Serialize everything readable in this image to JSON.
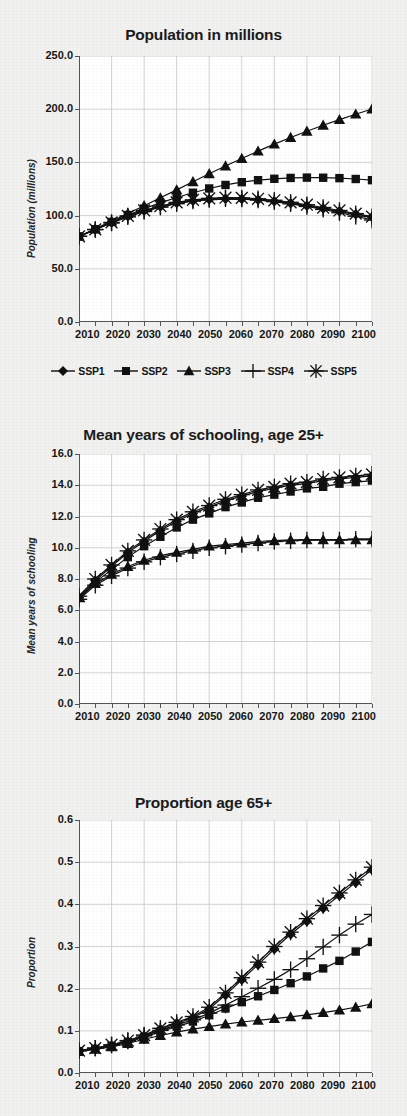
{
  "figure": {
    "background_color": "#f1f1ef",
    "plot_background_color": "#ffffff",
    "line_color": "#111111",
    "grid_color": "#c9c9c9"
  },
  "legend": {
    "position": "below-first-panel",
    "items": [
      {
        "label": "SSP1",
        "marker": "diamond-marker-icon"
      },
      {
        "label": "SSP2",
        "marker": "square-marker-icon"
      },
      {
        "label": "SSP3",
        "marker": "triangle-marker-icon"
      },
      {
        "label": "SSP4",
        "marker": "plus-marker-icon"
      },
      {
        "label": "SSP5",
        "marker": "asterisk-marker-icon"
      }
    ]
  },
  "chart_data": [
    {
      "id": "population",
      "type": "line",
      "title": "Population in millions",
      "xlabel": "",
      "ylabel": "Population (millions)",
      "xlim": [
        2010,
        2100
      ],
      "ylim": [
        0.0,
        250.0
      ],
      "yticks": [
        "0.0",
        "50.0",
        "100.0",
        "150.0",
        "200.0",
        "250.0"
      ],
      "ytick_values": [
        0,
        50,
        100,
        150,
        200,
        250
      ],
      "xticks": [
        "2010",
        "2020",
        "2030",
        "2040",
        "2050",
        "2060",
        "2070",
        "2080",
        "2090",
        "2100"
      ],
      "grid": true,
      "legend": "below",
      "x": [
        2010,
        2015,
        2020,
        2025,
        2030,
        2035,
        2040,
        2045,
        2050,
        2055,
        2060,
        2065,
        2070,
        2075,
        2080,
        2085,
        2090,
        2095,
        2100
      ],
      "series": [
        {
          "name": "SSP1",
          "marker": "diamond",
          "values": [
            80.5,
            87.0,
            93.5,
            99.5,
            104.5,
            108.5,
            111.8,
            114.0,
            115.3,
            115.8,
            115.6,
            114.8,
            113.4,
            111.5,
            109.2,
            106.7,
            104.0,
            101.3,
            98.7
          ]
        },
        {
          "name": "SSP2",
          "marker": "square",
          "values": [
            80.5,
            87.2,
            94.0,
            100.5,
            106.5,
            112.0,
            117.0,
            121.5,
            125.5,
            128.8,
            131.4,
            133.3,
            134.6,
            135.4,
            135.7,
            135.6,
            135.2,
            134.4,
            133.3
          ]
        },
        {
          "name": "SSP3",
          "marker": "triangle",
          "values": [
            80.5,
            87.5,
            94.8,
            102.0,
            109.3,
            116.7,
            124.2,
            131.8,
            139.3,
            146.6,
            153.7,
            160.6,
            167.2,
            173.4,
            179.3,
            184.9,
            190.2,
            195.3,
            200.2
          ]
        },
        {
          "name": "SSP4",
          "marker": "plus",
          "values": [
            80.5,
            86.8,
            93.0,
            98.8,
            103.8,
            107.9,
            111.2,
            113.6,
            115.1,
            115.7,
            115.5,
            114.6,
            113.1,
            111.1,
            108.6,
            105.8,
            102.7,
            99.4,
            95.9
          ]
        },
        {
          "name": "SSP5",
          "marker": "asterisk",
          "values": [
            80.5,
            87.0,
            93.6,
            99.7,
            104.9,
            109.0,
            112.4,
            114.8,
            116.2,
            116.8,
            116.6,
            115.8,
            114.4,
            112.5,
            110.2,
            107.6,
            104.8,
            101.9,
            99.0
          ]
        }
      ]
    },
    {
      "id": "schooling",
      "type": "line",
      "title": "Mean years of schooling, age 25+",
      "xlabel": "",
      "ylabel": "Mean years of schooling",
      "xlim": [
        2010,
        2100
      ],
      "ylim": [
        0.0,
        16.0
      ],
      "yticks": [
        "0.0",
        "2.0",
        "4.0",
        "6.0",
        "8.0",
        "10.0",
        "12.0",
        "14.0",
        "16.0"
      ],
      "ytick_values": [
        0,
        2,
        4,
        6,
        8,
        10,
        12,
        14,
        16
      ],
      "xticks": [
        "2010",
        "2020",
        "2030",
        "2040",
        "2050",
        "2060",
        "2070",
        "2080",
        "2090",
        "2100"
      ],
      "grid": true,
      "legend": "none",
      "x": [
        2010,
        2015,
        2020,
        2025,
        2030,
        2035,
        2040,
        2045,
        2050,
        2055,
        2060,
        2065,
        2070,
        2075,
        2080,
        2085,
        2090,
        2095,
        2100
      ],
      "series": [
        {
          "name": "SSP1",
          "marker": "diamond",
          "values": [
            6.8,
            7.9,
            8.8,
            9.7,
            10.4,
            11.1,
            11.7,
            12.2,
            12.6,
            13.0,
            13.3,
            13.6,
            13.8,
            14.0,
            14.1,
            14.3,
            14.4,
            14.5,
            14.6
          ]
        },
        {
          "name": "SSP2",
          "marker": "square",
          "values": [
            6.8,
            7.8,
            8.6,
            9.4,
            10.1,
            10.7,
            11.3,
            11.8,
            12.2,
            12.6,
            12.9,
            13.2,
            13.4,
            13.6,
            13.8,
            13.9,
            14.1,
            14.2,
            14.3
          ]
        },
        {
          "name": "SSP3",
          "marker": "triangle",
          "values": [
            6.8,
            7.7,
            8.3,
            8.8,
            9.2,
            9.5,
            9.7,
            9.9,
            10.1,
            10.2,
            10.3,
            10.4,
            10.45,
            10.5,
            10.5,
            10.5,
            10.5,
            10.5,
            10.5
          ]
        },
        {
          "name": "SSP4",
          "marker": "plus",
          "values": [
            6.7,
            7.6,
            8.2,
            8.7,
            9.1,
            9.4,
            9.6,
            9.8,
            10.0,
            10.1,
            10.2,
            10.3,
            10.4,
            10.45,
            10.5,
            10.5,
            10.5,
            10.55,
            10.55
          ]
        },
        {
          "name": "SSP5",
          "marker": "asterisk",
          "values": [
            6.9,
            8.0,
            8.9,
            9.8,
            10.5,
            11.2,
            11.8,
            12.3,
            12.7,
            13.1,
            13.4,
            13.7,
            13.9,
            14.1,
            14.2,
            14.4,
            14.5,
            14.6,
            14.7
          ]
        }
      ]
    },
    {
      "id": "proportion",
      "type": "line",
      "title": "Proportion age 65+",
      "xlabel": "",
      "ylabel": "Proportion",
      "xlim": [
        2010,
        2100
      ],
      "ylim": [
        0.0,
        0.6
      ],
      "yticks": [
        "0.0",
        "0.1",
        "0.2",
        "0.3",
        "0.4",
        "0.5",
        "0.6"
      ],
      "ytick_values": [
        0.0,
        0.1,
        0.2,
        0.3,
        0.4,
        0.5,
        0.6
      ],
      "xticks": [
        "2010",
        "2020",
        "2030",
        "2040",
        "2050",
        "2060",
        "2070",
        "2080",
        "2090",
        "2100"
      ],
      "grid": true,
      "legend": "none",
      "x": [
        2010,
        2015,
        2020,
        2025,
        2030,
        2035,
        2040,
        2045,
        2050,
        2055,
        2060,
        2065,
        2070,
        2075,
        2080,
        2085,
        2090,
        2095,
        2100
      ],
      "series": [
        {
          "name": "SSP1",
          "marker": "diamond",
          "values": [
            0.052,
            0.058,
            0.065,
            0.075,
            0.088,
            0.104,
            0.118,
            0.131,
            0.152,
            0.185,
            0.221,
            0.257,
            0.294,
            0.329,
            0.36,
            0.391,
            0.421,
            0.452,
            0.482
          ]
        },
        {
          "name": "SSP2",
          "marker": "square",
          "values": [
            0.052,
            0.057,
            0.064,
            0.073,
            0.085,
            0.098,
            0.11,
            0.122,
            0.137,
            0.153,
            0.168,
            0.182,
            0.197,
            0.213,
            0.229,
            0.248,
            0.266,
            0.288,
            0.311
          ]
        },
        {
          "name": "SSP3",
          "marker": "triangle",
          "values": [
            0.051,
            0.056,
            0.062,
            0.07,
            0.08,
            0.089,
            0.097,
            0.104,
            0.11,
            0.116,
            0.121,
            0.125,
            0.129,
            0.133,
            0.138,
            0.143,
            0.149,
            0.156,
            0.164
          ]
        },
        {
          "name": "SSP4",
          "marker": "plus",
          "values": [
            0.053,
            0.059,
            0.066,
            0.076,
            0.088,
            0.101,
            0.114,
            0.126,
            0.142,
            0.161,
            0.181,
            0.201,
            0.222,
            0.245,
            0.271,
            0.299,
            0.327,
            0.353,
            0.376
          ]
        },
        {
          "name": "SSP5",
          "marker": "asterisk",
          "values": [
            0.053,
            0.059,
            0.067,
            0.077,
            0.09,
            0.106,
            0.12,
            0.134,
            0.156,
            0.19,
            0.226,
            0.263,
            0.3,
            0.334,
            0.366,
            0.397,
            0.427,
            0.458,
            0.488
          ]
        }
      ]
    }
  ]
}
